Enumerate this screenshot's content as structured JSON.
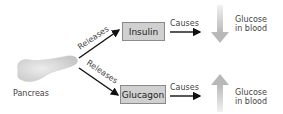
{
  "diagram": {
    "source": {
      "label": "Pancreas"
    },
    "branches": [
      {
        "edge_label": "Releases",
        "hormone": "Insulin",
        "effect_label": "Causes",
        "outcome_line1": "Glucose",
        "outcome_line2": "in blood",
        "direction": "down"
      },
      {
        "edge_label": "Releases",
        "hormone": "Glucagon",
        "effect_label": "Causes",
        "outcome_line1": "Glucose",
        "outcome_line2": "in blood",
        "direction": "up"
      }
    ],
    "colors": {
      "box_fill": "#d0d0d0",
      "box_border": "#8a8a8a",
      "arrow": "#111111",
      "trend_arrow": "#bdbdbd",
      "pancreas": "#d9d9d9"
    }
  }
}
